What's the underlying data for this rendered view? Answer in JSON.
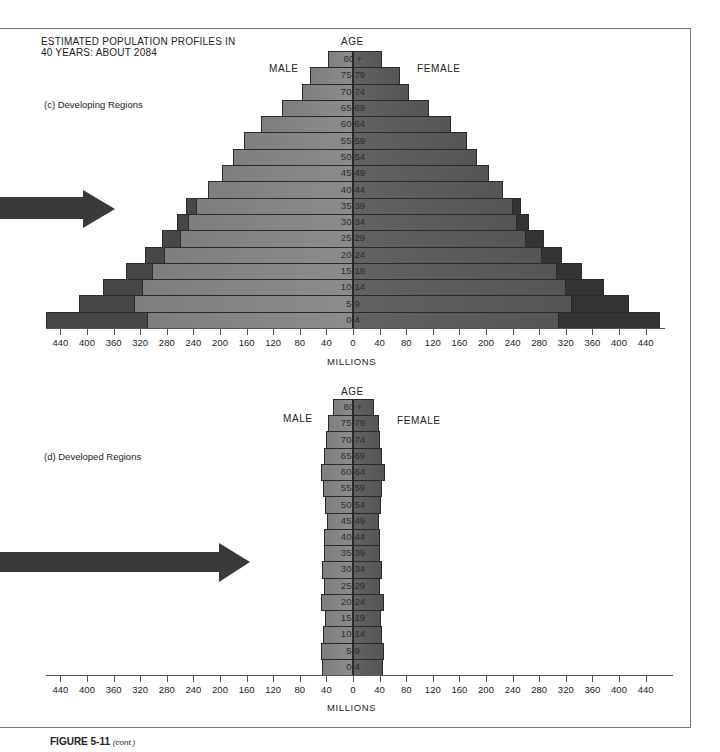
{
  "title_line1": "ESTIMATED POPULATION PROFILES IN",
  "title_line2": "40 YEARS: ABOUT 2084",
  "caption": {
    "figure": "FIGURE 5-11",
    "note": "(cont.)"
  },
  "labels": {
    "male": "MALE",
    "female": "FEMALE",
    "age": "AGE",
    "millions": "MILLIONS"
  },
  "colors": {
    "male_bar": "#878787",
    "female_bar": "#5a5a5a",
    "male_excess": "#474747",
    "female_excess": "#333333",
    "arrow": "#3a3a3a"
  },
  "chart_data": [
    {
      "type": "bar",
      "subtype": "population_pyramid",
      "title": "(c) Developing Regions",
      "xlabel": "MILLIONS",
      "ylabel": "AGE",
      "xlim": [
        -440,
        440
      ],
      "x_ticks": [
        440,
        400,
        360,
        320,
        280,
        240,
        200,
        160,
        120,
        80,
        40,
        0,
        40,
        80,
        120,
        160,
        200,
        240,
        280,
        320,
        360,
        400,
        440
      ],
      "categories": [
        "80 +",
        "75-79",
        "70-74",
        "65-69",
        "60-64",
        "55-59",
        "50-54",
        "45-49",
        "40-44",
        "35-39",
        "30-34",
        "25-29",
        "20-24",
        "15-19",
        "10-14",
        "5-9",
        "0-4"
      ],
      "series": [
        {
          "name": "Male",
          "values": [
            38,
            65,
            77,
            107,
            138,
            164,
            180,
            197,
            218,
            251,
            265,
            287,
            313,
            341,
            376,
            412,
            462
          ]
        },
        {
          "name": "Female",
          "values": [
            43,
            70,
            84,
            114,
            147,
            172,
            187,
            204,
            225,
            253,
            265,
            287,
            314,
            344,
            377,
            415,
            462
          ]
        },
        {
          "name": "Male (inner, lighter segment)",
          "values": [
            38,
            65,
            77,
            107,
            138,
            164,
            180,
            197,
            218,
            236,
            248,
            260,
            284,
            302,
            317,
            329,
            310
          ]
        },
        {
          "name": "Female (inner, lighter segment)",
          "values": [
            43,
            70,
            84,
            114,
            147,
            172,
            187,
            204,
            225,
            240,
            247,
            260,
            284,
            307,
            320,
            329,
            310
          ]
        }
      ],
      "annotations": [
        "MALE",
        "FEMALE",
        "arrow pointing at 35-39 cohort"
      ],
      "grid": false
    },
    {
      "type": "bar",
      "subtype": "population_pyramid",
      "title": "(d) Developed Regions",
      "xlabel": "MILLIONS",
      "ylabel": "AGE",
      "xlim": [
        -440,
        440
      ],
      "x_ticks": [
        440,
        400,
        360,
        320,
        280,
        240,
        200,
        160,
        120,
        80,
        40,
        0,
        40,
        80,
        120,
        160,
        200,
        240,
        280,
        320,
        360,
        400,
        440
      ],
      "categories": [
        "80 +",
        "75-79",
        "70-74",
        "65-69",
        "60-64",
        "55-59",
        "50-54",
        "45-49",
        "40-44",
        "35-39",
        "30-34",
        "25-29",
        "20-24",
        "15-19",
        "10-14",
        "5-9",
        "0-4"
      ],
      "series": [
        {
          "name": "Male",
          "values": [
            30,
            37,
            41,
            44,
            48,
            45,
            42,
            39,
            44,
            44,
            46,
            44,
            48,
            42,
            45,
            48,
            47
          ]
        },
        {
          "name": "Female",
          "values": [
            31,
            39,
            41,
            43,
            48,
            43,
            42,
            39,
            41,
            41,
            43,
            41,
            47,
            42,
            43,
            47,
            45
          ]
        }
      ],
      "annotations": [
        "MALE",
        "FEMALE",
        "arrow pointing at 35-39 cohort"
      ],
      "grid": false
    }
  ]
}
